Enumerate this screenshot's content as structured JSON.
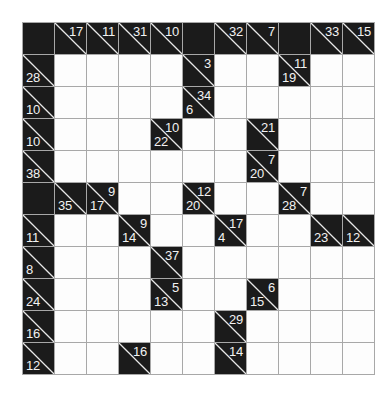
{
  "puzzle": {
    "type": "kakuro",
    "name": "Kakuro cross-sums grid",
    "rows": 11,
    "cols": 11,
    "colors": {
      "block": "#1b1b1b",
      "open": "#fdfdfd",
      "grid_line": "#a8a8a8",
      "clue_text": "#f2f2f2",
      "diagonal": "#e8e8e8"
    },
    "cells": [
      [
        {
          "t": "block"
        },
        {
          "t": "clue",
          "down": "17"
        },
        {
          "t": "clue",
          "down": "11"
        },
        {
          "t": "clue",
          "down": "31"
        },
        {
          "t": "clue",
          "down": "10"
        },
        {
          "t": "block"
        },
        {
          "t": "clue",
          "down": "32"
        },
        {
          "t": "clue",
          "down": "7"
        },
        {
          "t": "block"
        },
        {
          "t": "clue",
          "down": "33"
        },
        {
          "t": "clue",
          "down": "15"
        }
      ],
      [
        {
          "t": "clue",
          "across": "28"
        },
        {
          "t": "open"
        },
        {
          "t": "open"
        },
        {
          "t": "open"
        },
        {
          "t": "open"
        },
        {
          "t": "clue",
          "down": "3"
        },
        {
          "t": "open"
        },
        {
          "t": "open"
        },
        {
          "t": "clue",
          "down": "11",
          "across": "19"
        },
        {
          "t": "open"
        },
        {
          "t": "open"
        }
      ],
      [
        {
          "t": "clue",
          "across": "10"
        },
        {
          "t": "open"
        },
        {
          "t": "open"
        },
        {
          "t": "open"
        },
        {
          "t": "open"
        },
        {
          "t": "clue",
          "down": "34",
          "across": "6"
        },
        {
          "t": "open"
        },
        {
          "t": "open"
        },
        {
          "t": "open"
        },
        {
          "t": "open"
        },
        {
          "t": "open"
        }
      ],
      [
        {
          "t": "clue",
          "across": "10"
        },
        {
          "t": "open"
        },
        {
          "t": "open"
        },
        {
          "t": "open"
        },
        {
          "t": "clue",
          "down": "10",
          "across": "22"
        },
        {
          "t": "open"
        },
        {
          "t": "open"
        },
        {
          "t": "clue",
          "down": "21"
        },
        {
          "t": "open"
        },
        {
          "t": "open"
        },
        {
          "t": "open"
        }
      ],
      [
        {
          "t": "clue",
          "across": "38"
        },
        {
          "t": "open"
        },
        {
          "t": "open"
        },
        {
          "t": "open"
        },
        {
          "t": "open"
        },
        {
          "t": "open"
        },
        {
          "t": "open"
        },
        {
          "t": "clue",
          "down": "7",
          "across": "20"
        },
        {
          "t": "open"
        },
        {
          "t": "open"
        },
        {
          "t": "open"
        }
      ],
      [
        {
          "t": "block"
        },
        {
          "t": "clue",
          "across": "35"
        },
        {
          "t": "clue",
          "down": "9",
          "across": "17"
        },
        {
          "t": "open"
        },
        {
          "t": "open"
        },
        {
          "t": "clue",
          "down": "12",
          "across": "20"
        },
        {
          "t": "open"
        },
        {
          "t": "open"
        },
        {
          "t": "clue",
          "down": "7",
          "across": "28"
        },
        {
          "t": "open"
        },
        {
          "t": "open"
        }
      ],
      [
        {
          "t": "clue",
          "across": "11"
        },
        {
          "t": "open"
        },
        {
          "t": "open"
        },
        {
          "t": "clue",
          "down": "9",
          "across": "14"
        },
        {
          "t": "open"
        },
        {
          "t": "open"
        },
        {
          "t": "clue",
          "down": "17",
          "across": "4"
        },
        {
          "t": "open"
        },
        {
          "t": "open"
        },
        {
          "t": "clue",
          "across": "23"
        },
        {
          "t": "clue",
          "across": "12"
        }
      ],
      [
        {
          "t": "clue",
          "across": "8"
        },
        {
          "t": "open"
        },
        {
          "t": "open"
        },
        {
          "t": "open"
        },
        {
          "t": "clue",
          "down": "37"
        },
        {
          "t": "open"
        },
        {
          "t": "open"
        },
        {
          "t": "open"
        },
        {
          "t": "open"
        },
        {
          "t": "open"
        },
        {
          "t": "open"
        }
      ],
      [
        {
          "t": "clue",
          "across": "24"
        },
        {
          "t": "open"
        },
        {
          "t": "open"
        },
        {
          "t": "open"
        },
        {
          "t": "clue",
          "down": "5",
          "across": "13"
        },
        {
          "t": "open"
        },
        {
          "t": "open"
        },
        {
          "t": "clue",
          "down": "6",
          "across": "15"
        },
        {
          "t": "open"
        },
        {
          "t": "open"
        },
        {
          "t": "open"
        }
      ],
      [
        {
          "t": "clue",
          "across": "16"
        },
        {
          "t": "open"
        },
        {
          "t": "open"
        },
        {
          "t": "open"
        },
        {
          "t": "open"
        },
        {
          "t": "open"
        },
        {
          "t": "clue",
          "down": "29"
        },
        {
          "t": "open"
        },
        {
          "t": "open"
        },
        {
          "t": "open"
        },
        {
          "t": "open"
        }
      ],
      [
        {
          "t": "clue",
          "across": "12"
        },
        {
          "t": "open"
        },
        {
          "t": "open"
        },
        {
          "t": "clue",
          "down": "16"
        },
        {
          "t": "open"
        },
        {
          "t": "open"
        },
        {
          "t": "clue",
          "down": "14"
        },
        {
          "t": "open"
        },
        {
          "t": "open"
        },
        {
          "t": "open"
        },
        {
          "t": "open"
        }
      ]
    ]
  }
}
